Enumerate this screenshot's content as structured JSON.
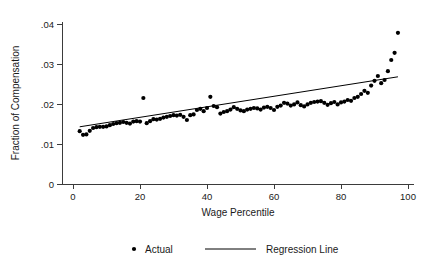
{
  "chart_data": {
    "type": "scatter",
    "title": "",
    "xlabel": "Wage Percentile",
    "ylabel": "Fraction of Compensation",
    "xlim": [
      0,
      104
    ],
    "ylim": [
      0,
      0.042
    ],
    "xticks": [
      0,
      20,
      40,
      60,
      80,
      100
    ],
    "xticklabels": [
      "0",
      "20",
      "40",
      "60",
      "80",
      "100"
    ],
    "yticks": [
      0,
      0.01,
      0.02,
      0.03,
      0.04
    ],
    "yticklabels": [
      "0",
      ".01",
      ".02",
      ".03",
      ".04"
    ],
    "grid": false,
    "legend_position": "bottom-center",
    "series": [
      {
        "name": "Actual",
        "type": "scatter",
        "marker": "filled-circle",
        "color": "#000000",
        "x": [
          2,
          3,
          4,
          5,
          6,
          7,
          8,
          9,
          10,
          11,
          12,
          13,
          14,
          15,
          16,
          17,
          18,
          19,
          20,
          21,
          22,
          23,
          24,
          25,
          26,
          27,
          28,
          29,
          30,
          31,
          32,
          33,
          34,
          35,
          36,
          37,
          38,
          39,
          40,
          41,
          42,
          43,
          44,
          45,
          46,
          47,
          48,
          49,
          50,
          51,
          52,
          53,
          54,
          55,
          56,
          57,
          58,
          59,
          60,
          61,
          62,
          63,
          64,
          65,
          66,
          67,
          68,
          69,
          70,
          71,
          72,
          73,
          74,
          75,
          76,
          77,
          78,
          79,
          80,
          81,
          82,
          83,
          84,
          85,
          86,
          87,
          88,
          89,
          90,
          91,
          92,
          93,
          94,
          95,
          96,
          97
        ],
        "y": [
          0.0132,
          0.0123,
          0.0124,
          0.0133,
          0.014,
          0.0142,
          0.0143,
          0.0143,
          0.0144,
          0.0147,
          0.015,
          0.0152,
          0.0153,
          0.0155,
          0.0153,
          0.0151,
          0.0156,
          0.0157,
          0.0156,
          0.0215,
          0.0152,
          0.0157,
          0.0162,
          0.0161,
          0.0163,
          0.0166,
          0.0168,
          0.017,
          0.0172,
          0.0171,
          0.0173,
          0.0168,
          0.016,
          0.0172,
          0.0174,
          0.0185,
          0.0188,
          0.0182,
          0.019,
          0.0218,
          0.0195,
          0.0192,
          0.0176,
          0.018,
          0.0182,
          0.0186,
          0.0192,
          0.0188,
          0.0184,
          0.0182,
          0.0186,
          0.0188,
          0.019,
          0.0189,
          0.0186,
          0.0191,
          0.0193,
          0.019,
          0.0185,
          0.0193,
          0.0196,
          0.0203,
          0.0201,
          0.0196,
          0.0199,
          0.0204,
          0.0197,
          0.0194,
          0.0199,
          0.0203,
          0.0205,
          0.0206,
          0.0207,
          0.0203,
          0.0198,
          0.0202,
          0.0205,
          0.0199,
          0.0204,
          0.0206,
          0.021,
          0.0208,
          0.0215,
          0.0218,
          0.0225,
          0.0233,
          0.0228,
          0.0246,
          0.0258,
          0.027,
          0.0252,
          0.026,
          0.0282,
          0.031,
          0.0328,
          0.0378
        ]
      },
      {
        "name": "Regression Line",
        "type": "line",
        "color": "#000000",
        "x": [
          2,
          97
        ],
        "y": [
          0.0143,
          0.0268
        ]
      }
    ]
  },
  "legend": {
    "items": [
      {
        "label": "Actual",
        "marker": "dot"
      },
      {
        "label": "Regression Line",
        "marker": "line"
      }
    ]
  }
}
